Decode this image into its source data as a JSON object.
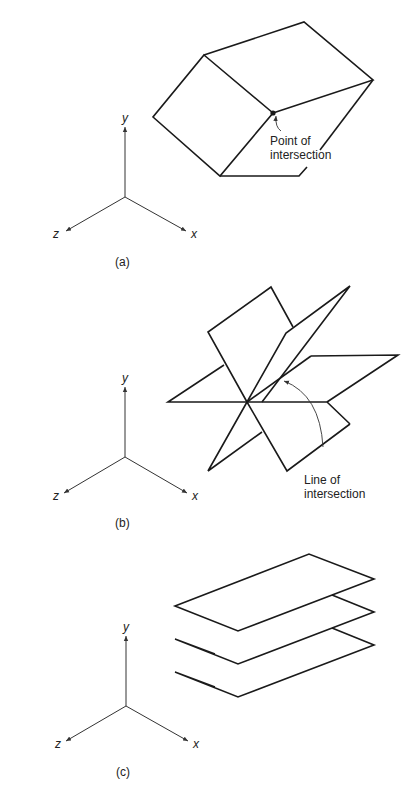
{
  "figure": {
    "panels": [
      {
        "id": "a",
        "caption": "(a)",
        "axes": {
          "y": "y",
          "x": "x",
          "z": "z"
        },
        "annotation": {
          "line1": "Point of",
          "line2": "intersection"
        },
        "description": "Three planes meeting at a single point"
      },
      {
        "id": "b",
        "caption": "(b)",
        "axes": {
          "y": "y",
          "x": "x",
          "z": "z"
        },
        "annotation": {
          "line1": "Line of",
          "line2": "intersection"
        },
        "description": "Three planes intersecting along a common line"
      },
      {
        "id": "c",
        "caption": "(c)",
        "axes": {
          "y": "y",
          "x": "x",
          "z": "z"
        },
        "description": "Three parallel planes with no intersection"
      }
    ],
    "colors": {
      "stroke": "#1a1a1a",
      "axis": "#333333",
      "background": "#ffffff"
    }
  }
}
